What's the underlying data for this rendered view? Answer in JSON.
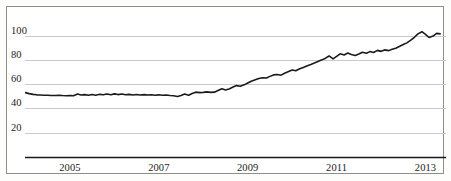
{
  "chart_data": {
    "type": "line",
    "title": "",
    "subtitle": "",
    "xlabel": "",
    "ylabel": "",
    "xlim": [
      2004.0,
      2013.45
    ],
    "ylim": [
      0,
      112
    ],
    "grid": true,
    "grid_axis": "y",
    "legend": "none",
    "line_color": "#1a1a1a",
    "gridline_color": "#c9c9c9",
    "axis_color": "#1a1a1a",
    "y_ticks": [
      20,
      40,
      60,
      80,
      100
    ],
    "y_tick_labels": [
      "20",
      "40",
      "60",
      "80",
      "100"
    ],
    "x_ticks": [
      2005,
      2007,
      2009,
      2011,
      2013
    ],
    "x_tick_labels": [
      "2005",
      "2007",
      "2009",
      "2011",
      "2013"
    ],
    "x": [
      2004.0,
      2004.08,
      2004.17,
      2004.25,
      2004.33,
      2004.42,
      2004.5,
      2004.58,
      2004.67,
      2004.75,
      2004.83,
      2004.92,
      2005.0,
      2005.08,
      2005.17,
      2005.25,
      2005.33,
      2005.42,
      2005.5,
      2005.58,
      2005.67,
      2005.75,
      2005.83,
      2005.92,
      2006.0,
      2006.08,
      2006.17,
      2006.25,
      2006.33,
      2006.42,
      2006.5,
      2006.58,
      2006.67,
      2006.75,
      2006.83,
      2006.92,
      2007.0,
      2007.08,
      2007.17,
      2007.25,
      2007.33,
      2007.42,
      2007.5,
      2007.58,
      2007.67,
      2007.75,
      2007.83,
      2007.92,
      2008.0,
      2008.08,
      2008.17,
      2008.25,
      2008.33,
      2008.42,
      2008.5,
      2008.58,
      2008.67,
      2008.75,
      2008.83,
      2008.92,
      2009.0,
      2009.08,
      2009.17,
      2009.25,
      2009.33,
      2009.42,
      2009.5,
      2009.58,
      2009.67,
      2009.75,
      2009.83,
      2009.92,
      2010.0,
      2010.08,
      2010.17,
      2010.25,
      2010.33,
      2010.42,
      2010.5,
      2010.58,
      2010.67,
      2010.75,
      2010.83,
      2010.92,
      2011.0,
      2011.08,
      2011.17,
      2011.25,
      2011.33,
      2011.42,
      2011.5,
      2011.58,
      2011.67,
      2011.75,
      2011.83,
      2011.92,
      2012.0,
      2012.08,
      2012.17,
      2012.25,
      2012.33,
      2012.42,
      2012.5,
      2012.58,
      2012.67,
      2012.75,
      2012.83,
      2012.92,
      2013.0,
      2013.08,
      2013.17,
      2013.25,
      2013.33
    ],
    "values": [
      53.0,
      52.2,
      51.6,
      51.2,
      51.0,
      50.8,
      50.9,
      50.7,
      50.6,
      50.8,
      50.6,
      50.5,
      50.7,
      50.4,
      51.8,
      51.0,
      51.4,
      50.9,
      51.5,
      50.9,
      51.6,
      51.2,
      51.9,
      51.3,
      52.0,
      51.4,
      51.9,
      51.3,
      51.6,
      51.1,
      51.5,
      51.0,
      51.4,
      51.0,
      51.3,
      50.9,
      51.2,
      50.8,
      51.1,
      50.6,
      50.4,
      49.8,
      50.6,
      51.8,
      50.9,
      52.3,
      53.4,
      53.0,
      53.2,
      53.6,
      53.2,
      53.4,
      54.8,
      56.2,
      55.2,
      56.0,
      57.6,
      58.8,
      58.2,
      59.4,
      61.0,
      62.4,
      63.6,
      64.6,
      65.2,
      65.0,
      66.4,
      67.6,
      68.0,
      67.4,
      69.0,
      70.4,
      71.6,
      71.0,
      72.6,
      73.8,
      75.0,
      76.2,
      77.4,
      78.6,
      80.0,
      81.4,
      83.2,
      80.8,
      82.8,
      85.0,
      84.0,
      85.6,
      84.4,
      83.6,
      84.8,
      86.2,
      85.4,
      86.8,
      86.0,
      87.8,
      87.0,
      88.2,
      87.6,
      88.8,
      89.6,
      91.2,
      92.6,
      94.0,
      96.2,
      98.6,
      101.4,
      103.2,
      101.0,
      98.4,
      99.6,
      101.8,
      101.4
    ]
  }
}
